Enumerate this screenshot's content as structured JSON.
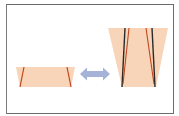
{
  "diagram": {
    "type": "lens-tilt-comparison",
    "colors": {
      "frame_border": "#6b6b6b",
      "fill": "#f8d5b8",
      "red_line": "#c2461c",
      "black_line": "#2a2a2a",
      "arrow": "#a5b3d9"
    },
    "left_shape": {
      "label": "",
      "top": [
        [
          16,
          67
        ],
        [
          75,
          67
        ]
      ],
      "bottom": [
        [
          20,
          87
        ],
        [
          71,
          87
        ]
      ],
      "lines": [
        {
          "color": "red",
          "from": [
            24,
            67
          ],
          "to": [
            20,
            87
          ]
        },
        {
          "color": "red",
          "from": [
            67,
            67
          ],
          "to": [
            71,
            87
          ]
        }
      ]
    },
    "arrow": {
      "type": "double-headed",
      "from": [
        80,
        74
      ],
      "to": [
        110,
        74
      ]
    },
    "right_shape": {
      "label": "",
      "top": [
        [
          108,
          28
        ],
        [
          168,
          28
        ]
      ],
      "bottom": [
        [
          122,
          87
        ],
        [
          156,
          87
        ]
      ],
      "lines": [
        {
          "color": "black",
          "from": [
            125,
            28
          ],
          "to": [
            122,
            87
          ]
        },
        {
          "color": "red",
          "from": [
            129,
            28
          ],
          "to": [
            123,
            84
          ]
        },
        {
          "color": "red",
          "from": [
            146,
            28
          ],
          "to": [
            154,
            84
          ]
        },
        {
          "color": "black",
          "from": [
            152,
            28
          ],
          "to": [
            155,
            87
          ]
        }
      ]
    }
  }
}
